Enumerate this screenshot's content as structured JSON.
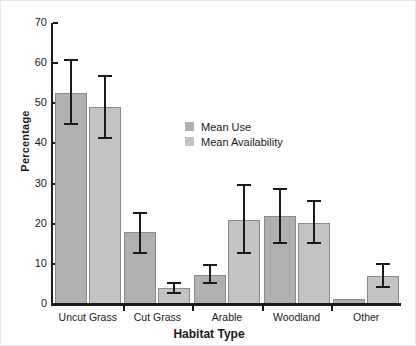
{
  "chart_data": {
    "type": "bar",
    "title": "",
    "xlabel": "Habitat Type",
    "ylabel": "Percentage",
    "categories": [
      "Uncut Grass",
      "Cut Grass",
      "Arable",
      "Woodland",
      "Other"
    ],
    "ylim": [
      0,
      70
    ],
    "yticks": [
      0,
      10,
      20,
      30,
      40,
      50,
      60,
      70
    ],
    "ytick_labels": [
      "0",
      "10",
      "20",
      "30",
      "40",
      "50",
      "60",
      "70"
    ],
    "grid": false,
    "legend_position": "center-upper-inside",
    "series": [
      {
        "name": "Mean Use",
        "color": "#b0b0b0",
        "values": [
          52.5,
          18.0,
          7.3,
          22.0,
          1.3
        ],
        "error_low": [
          44.5,
          12.5,
          5.0,
          15.0,
          1.3
        ],
        "error_high": [
          61.0,
          23.0,
          10.0,
          29.0,
          1.3
        ]
      },
      {
        "name": "Mean Availability",
        "color": "#c3c3c3",
        "values": [
          49.0,
          4.0,
          21.0,
          20.3,
          7.0
        ],
        "error_low": [
          41.0,
          2.5,
          12.5,
          15.0,
          4.0
        ],
        "error_high": [
          57.0,
          5.5,
          30.0,
          26.0,
          10.2
        ]
      }
    ]
  },
  "axis": {
    "y_title": "Percentage",
    "x_title": "Habitat Type",
    "y_ticks": [
      "70",
      "60",
      "50",
      "40",
      "30",
      "20",
      "10",
      "0"
    ],
    "x_ticks": [
      "Uncut Grass",
      "Cut Grass",
      "Arable",
      "Woodland",
      "Other"
    ]
  },
  "legend": {
    "items": [
      {
        "label": "Mean Use",
        "color": "#b0b0b0"
      },
      {
        "label": "Mean Availability",
        "color": "#c3c3c3"
      }
    ]
  }
}
